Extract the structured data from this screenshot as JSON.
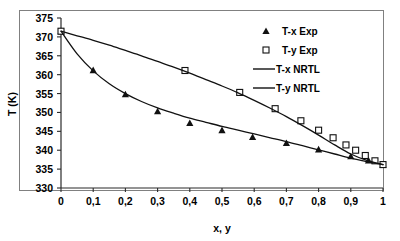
{
  "chart_data": {
    "type": "scatter",
    "title": "",
    "xlabel": "x, y",
    "ylabel": "T (K)",
    "xlim": [
      0,
      1
    ],
    "ylim": [
      330,
      375
    ],
    "grid": false,
    "legend_position": "top-right",
    "x_ticks": [
      "0",
      "0,1",
      "0,2",
      "0,3",
      "0,4",
      "0,5",
      "0,6",
      "0,7",
      "0,8",
      "0,9",
      "1"
    ],
    "x_tick_values": [
      0,
      0.1,
      0.2,
      0.3,
      0.4,
      0.5,
      0.6,
      0.7,
      0.8,
      0.9,
      1
    ],
    "y_ticks": [
      "330",
      "335",
      "340",
      "345",
      "350",
      "355",
      "360",
      "365",
      "370",
      "375"
    ],
    "y_tick_values": [
      330,
      335,
      340,
      345,
      350,
      355,
      360,
      365,
      370,
      375
    ],
    "series": [
      {
        "name": "T-x Exp",
        "marker": "filled-triangle",
        "style": "points",
        "x": [
          0.0,
          0.1,
          0.2,
          0.3,
          0.4,
          0.5,
          0.595,
          0.7,
          0.8,
          0.9,
          0.955,
          1.0
        ],
        "y": [
          371.5,
          361.2,
          354.8,
          350.3,
          347.2,
          345.3,
          343.5,
          341.9,
          340.2,
          338.4,
          337.3,
          336.2
        ]
      },
      {
        "name": "T-y Exp",
        "marker": "open-square",
        "style": "points",
        "x": [
          0.0,
          0.385,
          0.555,
          0.665,
          0.745,
          0.8,
          0.845,
          0.885,
          0.915,
          0.945,
          0.975,
          1.0
        ],
        "y": [
          371.5,
          361.1,
          355.3,
          351.0,
          347.8,
          345.3,
          343.3,
          341.4,
          340.0,
          338.6,
          337.2,
          336.2
        ]
      },
      {
        "name": "T-x NRTL",
        "marker": "line",
        "style": "line",
        "x": [
          0.0,
          0.05,
          0.1,
          0.15,
          0.2,
          0.25,
          0.3,
          0.35,
          0.4,
          0.45,
          0.5,
          0.55,
          0.6,
          0.65,
          0.7,
          0.75,
          0.8,
          0.85,
          0.9,
          0.95,
          1.0
        ],
        "y": [
          371.5,
          365.5,
          361.0,
          357.6,
          355.0,
          352.9,
          351.2,
          349.8,
          348.5,
          347.4,
          346.3,
          345.3,
          344.3,
          343.3,
          342.3,
          341.2,
          340.1,
          339.0,
          337.9,
          337.0,
          336.2
        ]
      },
      {
        "name": "T-y NRTL",
        "marker": "line",
        "style": "line",
        "x": [
          0.0,
          0.05,
          0.1,
          0.15,
          0.2,
          0.25,
          0.3,
          0.35,
          0.4,
          0.45,
          0.5,
          0.55,
          0.6,
          0.65,
          0.7,
          0.75,
          0.8,
          0.85,
          0.9,
          0.95,
          1.0
        ],
        "y": [
          371.5,
          370.3,
          369.1,
          367.8,
          366.4,
          365.0,
          363.5,
          362.0,
          360.4,
          358.7,
          357.0,
          355.2,
          353.2,
          351.1,
          348.9,
          346.5,
          344.0,
          341.4,
          339.0,
          337.3,
          336.2
        ]
      }
    ],
    "legend": [
      {
        "label": "T-x Exp",
        "marker": "filled-triangle"
      },
      {
        "label": "T-y Exp",
        "marker": "open-square"
      },
      {
        "label": "T-x NRTL",
        "marker": "line"
      },
      {
        "label": "T-y NRTL",
        "marker": "line"
      }
    ],
    "colors": {
      "series_line": "#111111",
      "marker_fill": "#111111",
      "marker_open_fill": "#ffffff",
      "axis": "#2b2b2b",
      "frame": "#808080",
      "background": "#ffffff"
    }
  }
}
